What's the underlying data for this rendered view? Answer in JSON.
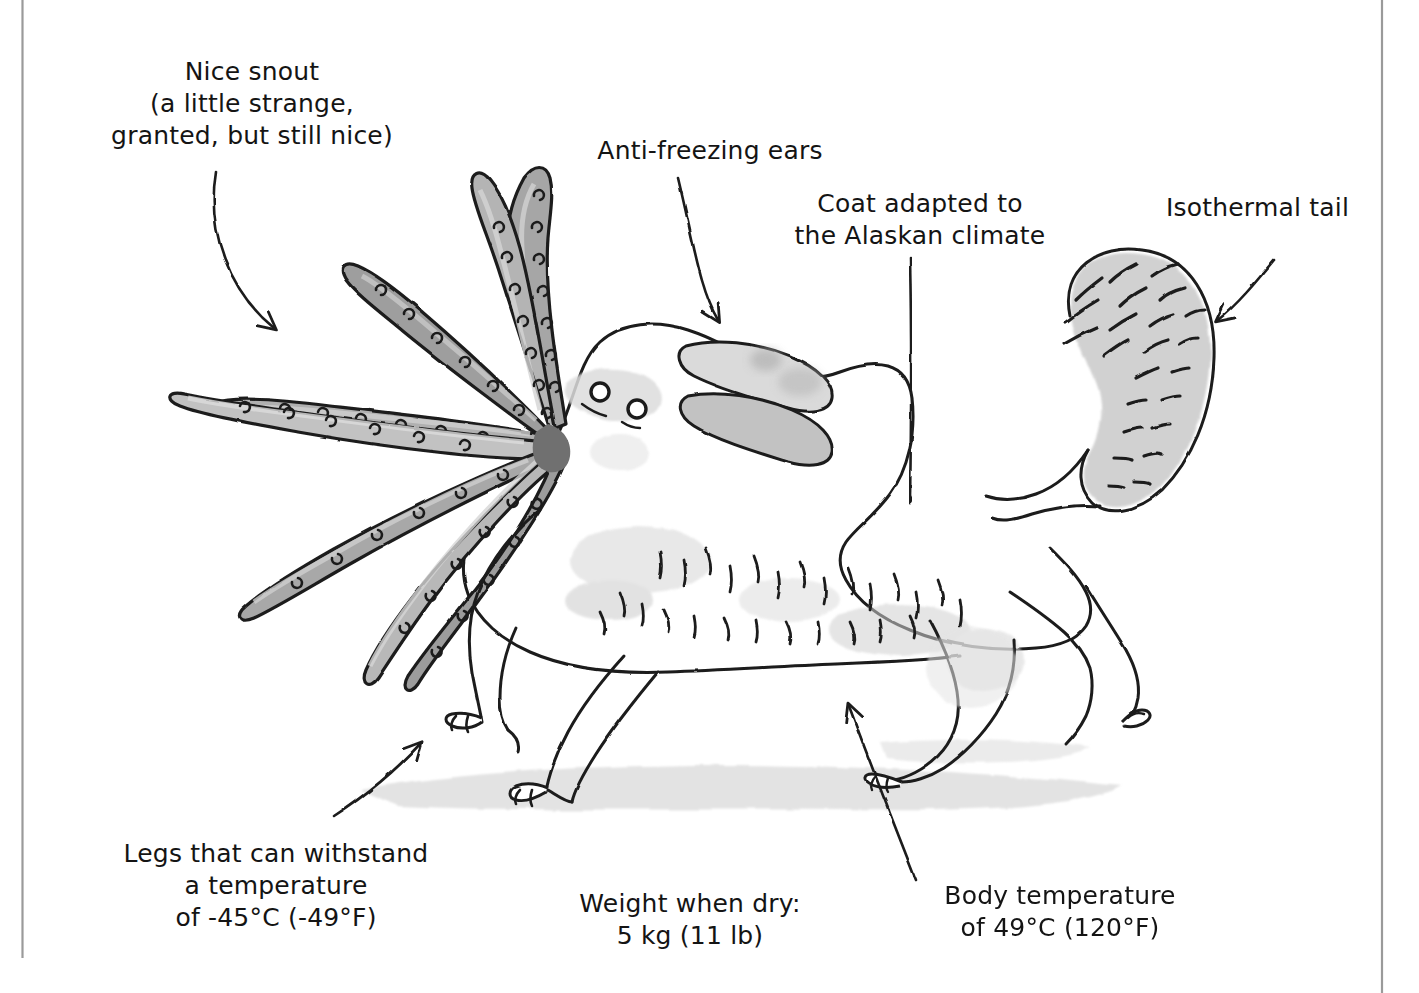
{
  "figure": {
    "kind": "hand-drawn-illustration",
    "page_border": {
      "left_rule_color": "#9a9a9a",
      "right_rule_color": "#9a9a9a",
      "background_color": "#ffffff"
    },
    "palette": {
      "ink": "#1b1b1b",
      "tentacle_fill": "#a0a0a0",
      "tentacle_light": "#c8c8c8",
      "ear_fill": "#c6c6c6",
      "tail_fill": "#c4c4c4",
      "body_fill": "#ffffff",
      "shadow_fill": "#dcdcdc",
      "ground_fill": "#e0e0e0",
      "patch_fill": "#d8d8d8"
    }
  },
  "annotations": [
    {
      "id": "nice-snout",
      "name": "label-nice-snout",
      "lines": [
        "Nice snout",
        "(a little strange,",
        "granted, but still nice)"
      ],
      "text": "Nice snout\n(a little strange,\ngranted, but still nice)",
      "x": 72,
      "y": 56,
      "width": 360,
      "points_to": "snout-tentacles"
    },
    {
      "id": "anti-freezing-ears",
      "name": "label-anti-freezing-ears",
      "lines": [
        "Anti-freezing ears"
      ],
      "text": "Anti-freezing ears",
      "x": 560,
      "y": 135,
      "width": 300,
      "points_to": "ears"
    },
    {
      "id": "coat-alaskan-climate",
      "name": "label-coat-adapted",
      "lines": [
        "Coat adapted to",
        "the Alaskan climate"
      ],
      "text": "Coat adapted to\nthe Alaskan climate",
      "x": 770,
      "y": 188,
      "width": 300,
      "points_to": "coat"
    },
    {
      "id": "isothermal-tail",
      "name": "label-isothermal-tail",
      "lines": [
        "Isothermal tail"
      ],
      "text": "Isothermal tail",
      "x": 1125,
      "y": 192,
      "width": 265,
      "points_to": "tail"
    },
    {
      "id": "legs-withstand",
      "name": "label-legs-temperature",
      "lines": [
        "Legs that can withstand",
        "a temperature",
        "of -45°C (-49°F)"
      ],
      "text": "Legs that can withstand\na temperature\nof -45°C (-49°F)",
      "x": 86,
      "y": 838,
      "width": 380,
      "points_to": "front-legs"
    },
    {
      "id": "weight-when-dry",
      "name": "label-weight-when-dry",
      "lines": [
        "Weight when dry:",
        "5 kg (11 lb)"
      ],
      "text": "Weight when dry:\n5 kg (11 lb)",
      "x": 540,
      "y": 888,
      "width": 300,
      "points_to": null
    },
    {
      "id": "body-temperature",
      "name": "label-body-temperature",
      "lines": [
        "Body temperature",
        "of 49°C (120°F)"
      ],
      "text": "Body temperature\nof 49°C (120°F)",
      "x": 920,
      "y": 880,
      "width": 280,
      "points_to": "body"
    }
  ],
  "measurements": {
    "weight_metric": "5 kg",
    "weight_imperial": "11 lb",
    "leg_temperature_metric": "-45°C",
    "leg_temperature_imperial": "-49°F",
    "body_temperature_metric": "49°C",
    "body_temperature_imperial": "120°F"
  },
  "creature_parts": [
    {
      "id": "snout-tentacles",
      "name": "snout-tentacles",
      "count": 7
    },
    {
      "id": "ears",
      "name": "ears",
      "count": 2
    },
    {
      "id": "eyes",
      "name": "eyes",
      "count": 2
    },
    {
      "id": "coat",
      "name": "coat"
    },
    {
      "id": "tail",
      "name": "tail"
    },
    {
      "id": "front-legs",
      "name": "front-legs",
      "count": 2
    },
    {
      "id": "hind-legs",
      "name": "hind-legs",
      "count": 2
    },
    {
      "id": "body",
      "name": "body"
    },
    {
      "id": "ground-shadow",
      "name": "ground-shadow"
    }
  ]
}
